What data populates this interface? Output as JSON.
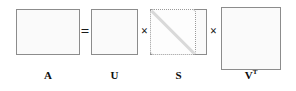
{
  "figure": {
    "background_color": "#ffffff",
    "border_color": "#8c8c8c",
    "fill_color": "#fbfbfb",
    "diagonal_color": "#d9d9d9",
    "text_color": "#0d0d0d"
  },
  "equation": {
    "operators": {
      "equals": "=",
      "times_1": "×",
      "times_2": "×"
    }
  },
  "matrices": [
    {
      "id": "A",
      "label": "A",
      "shape": "wide-rectangle",
      "role": "original data matrix"
    },
    {
      "id": "U",
      "label": "U",
      "shape": "square",
      "role": "left singular vectors"
    },
    {
      "id": "S",
      "label": "S",
      "shape": "rectangle-with-dotted-diagonal-block",
      "role": "singular values on diagonal"
    },
    {
      "id": "VT",
      "label": "V",
      "superscript": "T",
      "shape": "square",
      "role": "right singular vectors transposed"
    }
  ]
}
